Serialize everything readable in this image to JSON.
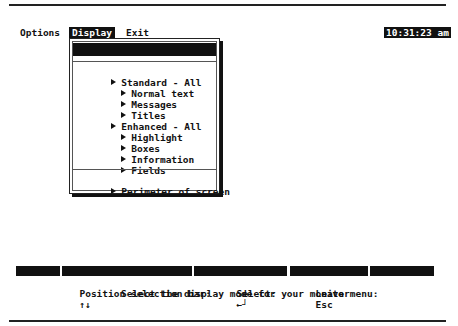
{
  "menubar": {
    "items": [
      {
        "label": "Options",
        "active": false
      },
      {
        "label": "Display",
        "active": true
      },
      {
        "label": "Exit",
        "active": false
      }
    ],
    "clock": "10:31:23 am"
  },
  "display_menu": {
    "header_label": "Display mode",
    "header_value": "MONO",
    "items": [
      {
        "label": "Standard - All",
        "level": 0
      },
      {
        "label": "Normal text",
        "level": 1
      },
      {
        "label": "Messages",
        "level": 1
      },
      {
        "label": "Titles",
        "level": 1
      },
      {
        "label": "Enhanced - All",
        "level": 0
      },
      {
        "label": "Highlight",
        "level": 1
      },
      {
        "label": "Boxes",
        "level": 1
      },
      {
        "label": "Information",
        "level": 1
      },
      {
        "label": "Fields",
        "level": 1
      }
    ],
    "footer_item": "Perimeter of screen"
  },
  "function_keys": [
    {
      "label": ""
    },
    {
      "label": ""
    },
    {
      "label": ""
    },
    {
      "label": ""
    },
    {
      "label": ""
    }
  ],
  "status": {
    "position_label": "Position selection bar:",
    "position_keys": "↑↓",
    "select_label": "Select:",
    "select_key": "←┘",
    "leave_label": "Leave menu:",
    "leave_key": "Esc",
    "help_text": "Select the display mode for your monitor"
  }
}
